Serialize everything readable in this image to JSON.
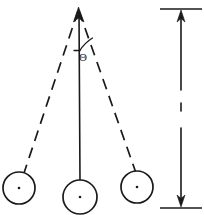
{
  "diagram": {
    "type": "physics-schematic",
    "background_color": "#ffffff",
    "ink_color": "#1a1a1a"
  },
  "labels": {
    "angle_symbol": "Θ",
    "length_symbol": ""
  },
  "pivot": {
    "name": "pivot-point",
    "x": 78,
    "y": 10
  },
  "strings": [
    {
      "name": "string-left-displaced",
      "style": "dashed",
      "from_x": 78,
      "from_y": 11,
      "to_x": 24,
      "to_y": 173
    },
    {
      "name": "string-center-rest",
      "style": "solid",
      "from_x": 79,
      "from_y": 11,
      "to_x": 80,
      "to_y": 182
    },
    {
      "name": "string-right-displaced",
      "style": "dashed",
      "from_x": 79,
      "from_y": 11,
      "to_x": 136,
      "to_y": 173
    }
  ],
  "bobs": [
    {
      "name": "bob-left",
      "cx": 19,
      "cy": 188,
      "r": 16
    },
    {
      "name": "bob-center",
      "cx": 80,
      "cy": 197,
      "r": 17
    },
    {
      "name": "bob-right",
      "cx": 137,
      "cy": 187,
      "r": 16
    }
  ],
  "angle_marker": {
    "name": "angle-arc",
    "cx": 79,
    "cy": 11,
    "radius": 40,
    "from_angle_deg": 0,
    "to_angle_deg": 19,
    "label_x": 83,
    "label_y": 58
  },
  "measure": {
    "name": "length-measure-arrow",
    "x": 181,
    "top_tick_y": 9,
    "bottom_tick_y": 208,
    "tick_half_width": 21,
    "upper_segment": {
      "from_y": 14,
      "to_y": 90
    },
    "middle_dash": {
      "from_y": 103,
      "to_y": 111
    },
    "lower_segment": {
      "from_y": 128,
      "to_y": 203
    },
    "arrowheads": [
      "up",
      "down"
    ]
  }
}
